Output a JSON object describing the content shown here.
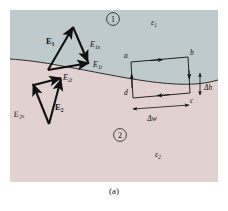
{
  "figure": {
    "caption": "(a)",
    "regions": {
      "upper": {
        "number_label": "1",
        "permittivity_label": "ε",
        "permittivity_sub": "1",
        "fill_color": "#c3ced1"
      },
      "lower": {
        "number_label": "2",
        "permittivity_label": "ε",
        "permittivity_sub": "2",
        "fill_color": "#e5d6d5"
      }
    },
    "upper_triangle": {
      "resultant_label": "E",
      "resultant_sub": "1",
      "normal_label": "E",
      "normal_sub": "1n",
      "tangential_label": "E",
      "tangential_sub": "1t"
    },
    "lower_triangle": {
      "resultant_label": "E",
      "resultant_sub": "2",
      "normal_label": "E",
      "normal_sub": "2n",
      "tangential_label": "E",
      "tangential_sub": "2t"
    },
    "loop": {
      "corner_a": "a",
      "corner_b": "b",
      "corner_c": "c",
      "corner_d": "d",
      "width_label": "Δw",
      "height_label": "Δh"
    },
    "colors": {
      "ink": "#111111",
      "boundary": "#1a1a1a",
      "background": "#ffffff"
    }
  }
}
